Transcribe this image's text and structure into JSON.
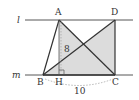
{
  "diagram": {
    "lines": [
      {
        "label": "l",
        "y": 20
      },
      {
        "label": "m",
        "y": 75
      }
    ],
    "points": {
      "A": {
        "label": "A",
        "x": 59,
        "y": 20
      },
      "D": {
        "label": "D",
        "x": 115,
        "y": 20
      },
      "B": {
        "label": "B",
        "x": 43,
        "y": 75
      },
      "H": {
        "label": "H",
        "x": 59,
        "y": 75
      },
      "C": {
        "label": "C",
        "x": 115,
        "y": 75
      }
    },
    "measurements": {
      "height_AH": "8",
      "base_BC": "10"
    },
    "colors": {
      "shade": "#d9d9d9",
      "stroke": "#333333"
    }
  }
}
